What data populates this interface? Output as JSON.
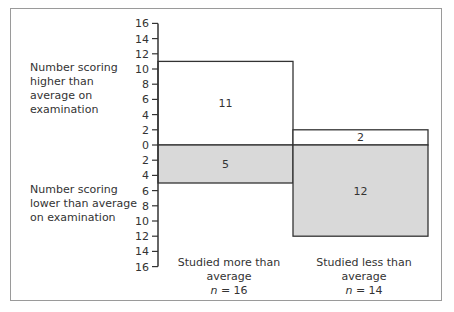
{
  "chart_data": {
    "type": "bar",
    "title": "",
    "xlabel": "",
    "ylabel_top": "Number scoring higher than average on examination",
    "ylabel_bottom": "Number scoring lower than average on examination",
    "y_ticks": [
      16,
      14,
      12,
      10,
      8,
      6,
      4,
      2,
      0,
      2,
      4,
      6,
      8,
      10,
      12,
      14,
      16
    ],
    "ylim": [
      -16,
      16
    ],
    "grid": false,
    "categories": [
      {
        "label": "Studied more than average",
        "n_label": "n",
        "n_value": "= 16"
      },
      {
        "label": "Studied less than average",
        "n_label": "n",
        "n_value": "= 14"
      }
    ],
    "series": [
      {
        "name": "Higher than average",
        "values": [
          11,
          2
        ],
        "color": "#ffffff"
      },
      {
        "name": "Lower than average",
        "values": [
          5,
          12
        ],
        "color": "#d9d9d9"
      }
    ]
  }
}
